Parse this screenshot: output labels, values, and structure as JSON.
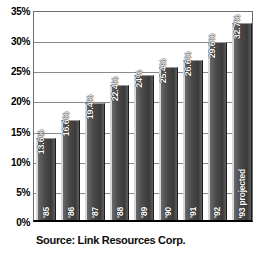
{
  "chart_data": {
    "type": "bar",
    "title": "",
    "subtitle": "",
    "xlabel": "",
    "ylabel": "",
    "categories": [
      "'85",
      "'86",
      "'87",
      "'88",
      "'89",
      "'90",
      "'91",
      "'92",
      "'93 projected"
    ],
    "values": [
      13.6,
      16.6,
      19.4,
      22.4,
      24,
      25.4,
      26.6,
      29.6,
      32.7
    ],
    "data_labels": [
      "13.6%",
      "16.6%",
      "19.4%",
      "22.4%",
      "24%",
      "25.4%",
      "26.6%",
      "29.6%",
      "32.7%"
    ],
    "ylim": [
      0,
      35
    ],
    "ytick_values": [
      0,
      5,
      10,
      15,
      20,
      25,
      30,
      35
    ],
    "ytick_labels": [
      "0%",
      "5%",
      "10%",
      "15%",
      "20%",
      "25%",
      "30%",
      "35%"
    ],
    "grid": true,
    "grid_axis": "y",
    "legend": null,
    "legend_position": "none",
    "annotation": "Source: Link Resources Corp.",
    "series": [
      {
        "name": "",
        "values": [
          13.6,
          16.6,
          19.4,
          22.4,
          24,
          25.4,
          26.6,
          29.6,
          32.7
        ]
      }
    ],
    "colors": {
      "bar_fill_dark": "#3a3a3a",
      "bar_fill_mid": "#4a4a4a",
      "bar_highlight": "#d8d8d8",
      "grid": "#8a8a8a",
      "frame": "#6e6e6e",
      "axis": "#000000",
      "background": "#ffffff",
      "text": "#000000",
      "bar_label_text": "#ffffff"
    }
  },
  "caption": {
    "source_text": "Source: Link Resources Corp."
  }
}
